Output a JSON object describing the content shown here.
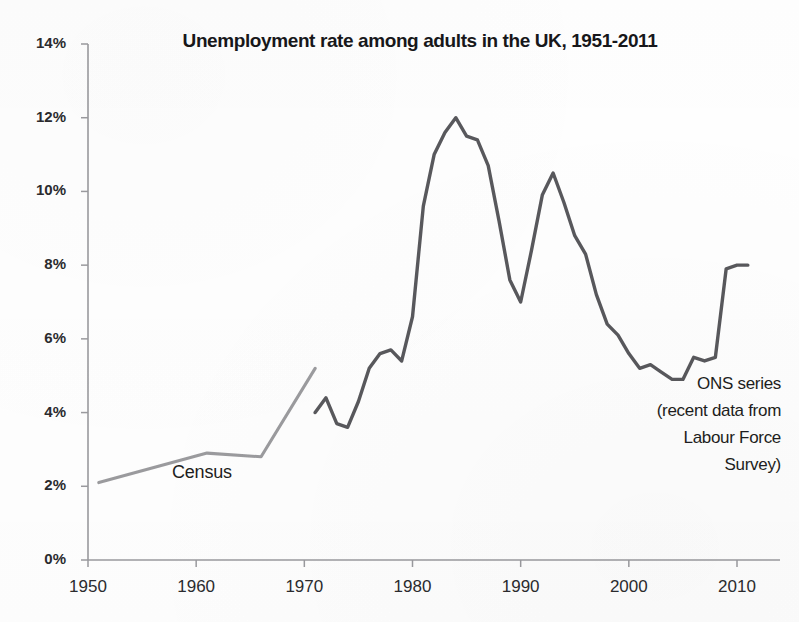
{
  "chart_data": {
    "type": "line",
    "title": "Unemployment rate among adults in the UK, 1951-2011",
    "xlabel": "",
    "ylabel": "",
    "xlim": [
      1950,
      2012
    ],
    "ylim": [
      0,
      14
    ],
    "grid": false,
    "legend_position": "none",
    "y_tick_labels": [
      "14%",
      "12%",
      "10%",
      "8%",
      "6%",
      "4%",
      "2%",
      "0%"
    ],
    "y_tick_values": [
      14,
      12,
      10,
      8,
      6,
      4,
      2,
      0
    ],
    "x_tick_labels": [
      "1950",
      "1960",
      "1970",
      "1980",
      "1990",
      "2000",
      "2010"
    ],
    "x_tick_values": [
      1950,
      1960,
      1970,
      1980,
      1990,
      2000,
      2010
    ],
    "series": [
      {
        "name": "Census",
        "color": "#8d8d91",
        "annotation": "Census",
        "x": [
          1951,
          1961,
          1966,
          1971
        ],
        "values": [
          2.1,
          2.9,
          2.8,
          5.2
        ]
      },
      {
        "name": "ONS series (recent data from Labour Force Survey)",
        "color": "#4b4b50",
        "annotation_lines": [
          "ONS series",
          "(recent data from",
          "Labour Force",
          "Survey)"
        ],
        "x": [
          1971,
          1972,
          1973,
          1974,
          1975,
          1976,
          1977,
          1978,
          1979,
          1980,
          1981,
          1982,
          1983,
          1984,
          1985,
          1986,
          1987,
          1988,
          1989,
          1990,
          1991,
          1992,
          1993,
          1994,
          1995,
          1996,
          1997,
          1998,
          1999,
          2000,
          2001,
          2002,
          2003,
          2004,
          2005,
          2006,
          2007,
          2008,
          2009,
          2010,
          2011
        ],
        "values": [
          4.0,
          4.4,
          3.7,
          3.6,
          4.3,
          5.2,
          5.6,
          5.7,
          5.4,
          6.6,
          9.6,
          11.0,
          11.6,
          12.0,
          11.5,
          11.4,
          10.7,
          9.2,
          7.6,
          7.0,
          8.4,
          9.9,
          10.5,
          9.7,
          8.8,
          8.3,
          7.2,
          6.4,
          6.1,
          5.6,
          5.2,
          5.3,
          5.1,
          4.9,
          4.9,
          5.5,
          5.4,
          5.5,
          7.9,
          8.0,
          8.0
        ]
      }
    ],
    "annotations": [
      {
        "text": "Census",
        "target": "census-series-label"
      },
      {
        "text": "ONS series (recent data from Labour Force Survey)",
        "target": "ons-series-label"
      }
    ]
  },
  "axis": {
    "y_axis_name": "unemployment-rate-percent",
    "x_axis_name": "year"
  },
  "notes": {
    "census_label": "Census",
    "ons_line_1": "ONS series",
    "ons_line_2": "(recent data from",
    "ons_line_3": "Labour Force",
    "ons_line_4": "Survey)"
  },
  "colors": {
    "census_line": "#8d8d91",
    "ons_line": "#4b4b50",
    "axis": "#9a9a9e",
    "text": "#1d1d20",
    "background": "#fefefe"
  }
}
